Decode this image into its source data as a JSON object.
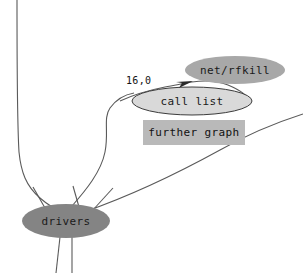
{
  "diagram": {
    "background_color": "#ffffff",
    "edge_color": "#555555",
    "nodes": [
      {
        "id": "net-rfkill",
        "label": "net/rfkill",
        "shape": "ellipse",
        "fill": "#a8a8a8",
        "stroke": "none",
        "cx": 235,
        "cy": 70,
        "rx": 50,
        "ry": 14
      },
      {
        "id": "call-list",
        "label": "call list",
        "shape": "ellipse",
        "fill": "#d6d6d6",
        "stroke": "#3c3c3c",
        "cx": 192,
        "cy": 101,
        "rx": 60,
        "ry": 14
      },
      {
        "id": "further-graph",
        "label": "further graph",
        "shape": "rect",
        "fill": "#b9b9b9",
        "stroke": "none",
        "x": 143,
        "y": 120,
        "width": 102,
        "height": 25
      },
      {
        "id": "drivers",
        "label": "drivers",
        "shape": "ellipse",
        "fill": "#848484",
        "stroke": "none",
        "cx": 66,
        "cy": 221,
        "rx": 44,
        "ry": 17
      }
    ],
    "edge_labels": [
      {
        "id": "edge-weight",
        "text": "16,0",
        "x": 126,
        "y": 75
      }
    ],
    "arrowheads": [
      {
        "id": "arrow-to-net-rfkill",
        "target": "net-rfkill",
        "x": 192,
        "y": 82
      }
    ]
  }
}
